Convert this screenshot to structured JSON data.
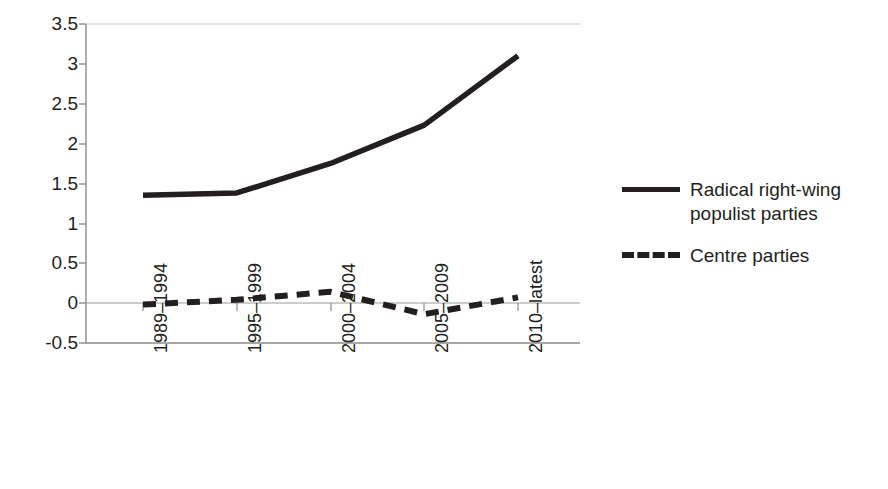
{
  "chart_data": {
    "type": "line",
    "title": "",
    "subtitle": "",
    "xlabel": "",
    "ylabel": "",
    "categories": [
      "1989–1994",
      "1995–1999",
      "2000–2004",
      "2005–2009",
      "2010–latest"
    ],
    "series": [
      {
        "name": "Radical right-wing populist parties",
        "style": "solid",
        "color": "#231f20",
        "values": [
          1.35,
          1.38,
          1.75,
          2.23,
          3.1
        ]
      },
      {
        "name": "Centre parties",
        "style": "dashed",
        "color": "#231f20",
        "values": [
          -0.02,
          0.04,
          0.14,
          -0.14,
          0.07
        ]
      }
    ],
    "ylim": [
      -0.5,
      3.5
    ],
    "yticks": [
      -0.5,
      0,
      0.5,
      1,
      1.5,
      2,
      2.5,
      3,
      3.5
    ],
    "ytick_labels": [
      "-0.5",
      "0",
      "0.5",
      "1",
      "1.5",
      "2",
      "2.5",
      "3",
      "3.5"
    ],
    "grid": false,
    "zero_line": true,
    "legend_position": "right",
    "legend_entries": [
      "Radical right-wing populist parties",
      "Centre parties"
    ]
  },
  "legend": {
    "entries": [
      {
        "label_line1": "Radical right-wing",
        "label_line2": "populist parties",
        "style": "solid"
      },
      {
        "label_line1": "Centre parties",
        "label_line2": "",
        "style": "dashed"
      }
    ]
  }
}
